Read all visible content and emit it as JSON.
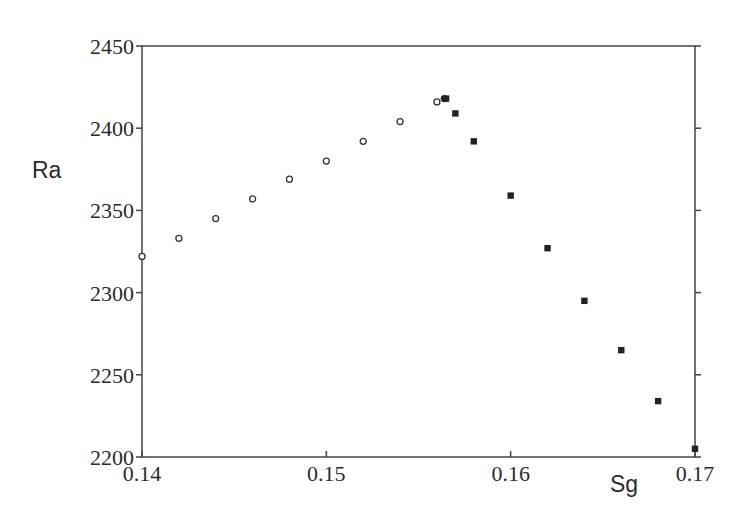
{
  "chart_data": {
    "type": "scatter",
    "title": "",
    "xlabel": "Sg",
    "ylabel": "Ra",
    "xlim": [
      0.14,
      0.17
    ],
    "ylim": [
      2200,
      2450
    ],
    "x_ticks": [
      "0.14",
      "0.15",
      "0.16",
      "0.17"
    ],
    "y_ticks": [
      "2200",
      "2250",
      "2300",
      "2350",
      "2400",
      "2450"
    ],
    "grid": false,
    "legend": null,
    "series": [
      {
        "name": "open circles",
        "marker": "open-circle",
        "color": "#333333",
        "points": [
          {
            "x": 0.14,
            "y": 2322
          },
          {
            "x": 0.142,
            "y": 2333
          },
          {
            "x": 0.144,
            "y": 2345
          },
          {
            "x": 0.146,
            "y": 2357
          },
          {
            "x": 0.148,
            "y": 2369
          },
          {
            "x": 0.15,
            "y": 2380
          },
          {
            "x": 0.152,
            "y": 2392
          },
          {
            "x": 0.154,
            "y": 2404
          },
          {
            "x": 0.156,
            "y": 2416
          }
        ]
      },
      {
        "name": "filled circle",
        "marker": "filled-circle",
        "color": "#222222",
        "points": [
          {
            "x": 0.1564,
            "y": 2418
          }
        ]
      },
      {
        "name": "filled squares",
        "marker": "filled-square",
        "color": "#222222",
        "points": [
          {
            "x": 0.1565,
            "y": 2418
          },
          {
            "x": 0.157,
            "y": 2409
          },
          {
            "x": 0.158,
            "y": 2392
          },
          {
            "x": 0.16,
            "y": 2359
          },
          {
            "x": 0.162,
            "y": 2327
          },
          {
            "x": 0.164,
            "y": 2295
          },
          {
            "x": 0.166,
            "y": 2265
          },
          {
            "x": 0.168,
            "y": 2234
          },
          {
            "x": 0.17,
            "y": 2205
          }
        ]
      }
    ]
  },
  "axes": {
    "xlabel": "Sg",
    "ylabel": "Ra",
    "x_tick_labels": [
      "0.14",
      "0.15",
      "0.16",
      "0.17"
    ],
    "y_tick_labels": [
      "2200",
      "2250",
      "2300",
      "2350",
      "2400",
      "2450"
    ]
  }
}
